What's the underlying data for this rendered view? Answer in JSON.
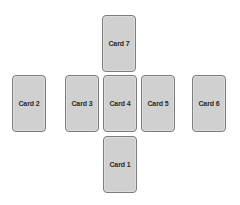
{
  "layout": {
    "background": "#ffffff",
    "card_fill": "#d0d0d0",
    "card_border": "#7d7d7d",
    "text_color": "#2a2a2a"
  },
  "cards": [
    {
      "id": "card-7",
      "label": "Card 7",
      "x": 102,
      "y": 15
    },
    {
      "id": "card-2",
      "label": "Card 2",
      "x": 12,
      "y": 75
    },
    {
      "id": "card-3",
      "label": "Card 3",
      "x": 65,
      "y": 75
    },
    {
      "id": "card-4",
      "label": "Card 4",
      "x": 103,
      "y": 75
    },
    {
      "id": "card-5",
      "label": "Card 5",
      "x": 141,
      "y": 75
    },
    {
      "id": "card-6",
      "label": "Card 6",
      "x": 192,
      "y": 75
    },
    {
      "id": "card-1",
      "label": "Card 1",
      "x": 103,
      "y": 136
    }
  ]
}
